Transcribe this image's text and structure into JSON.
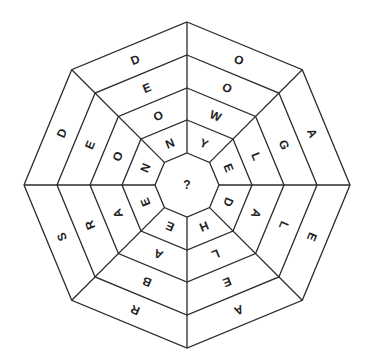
{
  "puzzle": {
    "title": "Octagonal word wheel",
    "center_label": "?",
    "rings": 4,
    "sectors_clockwise_from_top": [
      {
        "id": 1,
        "letters_outer_to_inner": [
          "O",
          "O",
          "W",
          "Y"
        ]
      },
      {
        "id": 2,
        "letters_outer_to_inner": [
          "A",
          "G",
          "L",
          "E"
        ]
      },
      {
        "id": 3,
        "letters_outer_to_inner": [
          "E",
          "L",
          "A",
          "D"
        ]
      },
      {
        "id": 4,
        "letters_outer_to_inner": [
          "A",
          "E",
          "L",
          "H"
        ]
      },
      {
        "id": 5,
        "letters_outer_to_inner": [
          "R",
          "B",
          "A",
          "E"
        ]
      },
      {
        "id": 6,
        "letters_outer_to_inner": [
          "S",
          "R",
          "A",
          "E"
        ]
      },
      {
        "id": 7,
        "letters_outer_to_inner": [
          "D",
          "E",
          "O",
          "N"
        ]
      },
      {
        "id": 8,
        "letters_outer_to_inner": [
          "D",
          "E",
          "O",
          "N"
        ]
      }
    ],
    "colors": {
      "line": "#2a2a2a",
      "text": "#222222",
      "background": "#ffffff"
    }
  }
}
